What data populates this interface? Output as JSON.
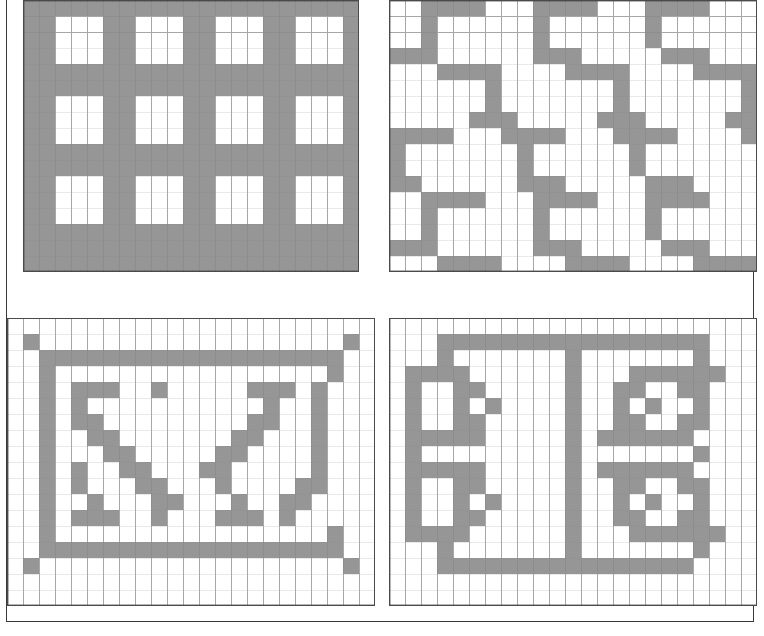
{
  "page": {
    "width": 764,
    "height": 636,
    "background_color": "#ffffff",
    "border_color": "#3a3a3a"
  },
  "style": {
    "fill_color": "#969696",
    "empty_color": "#ffffff",
    "gridline_color": "#8a8a8a",
    "panel_border_color": "#4a4a4a",
    "cell_size": 16
  },
  "panels": [
    {
      "id": "panel-top-left",
      "name": "lattice-grid-pattern",
      "description": "Regular lattice / window-pane grid of thick gray bars forming 4 rows by 5 columns of white squares",
      "cols": 21,
      "rows": 17,
      "origin_x": 22,
      "origin_y": 10,
      "rule": {
        "type": "lattice",
        "bar_cols": [
          0,
          1,
          5,
          6,
          10,
          11,
          15,
          16,
          20
        ],
        "bar_rows": [
          0,
          4,
          5,
          9,
          10,
          14,
          15,
          16
        ]
      }
    },
    {
      "id": "panel-top-right",
      "name": "zigzag-stair-pattern",
      "description": "Diagonal zigzag staircase bands of gray repeating across the grid",
      "cols": 23,
      "rows": 17,
      "origin_x": 398,
      "origin_y": 10,
      "rule": {
        "type": "zigzag",
        "period_x": 8,
        "period_y": 5,
        "segment_len": 4,
        "step": 3
      }
    },
    {
      "id": "panel-bottom-left",
      "name": "framed-z-glyph-pattern",
      "description": "Rectangular gray border frame with isolated corner dots, enclosing two mirrored diagonal Z-shaped glyphs",
      "cols": 23,
      "rows": 18,
      "origin_x": 22,
      "origin_y": 312,
      "rule": {
        "type": "framed-glyphs"
      }
    },
    {
      "id": "panel-bottom-right",
      "name": "maze-nested-squares-pattern",
      "description": "Maze-like pattern of nested square spirals with thick gray walls on left and right halves",
      "cols": 23,
      "rows": 18,
      "origin_x": 398,
      "origin_y": 312,
      "rule": {
        "type": "maze-nested"
      }
    }
  ],
  "pattern_data": {
    "panel-top-left": {
      "cols": 21,
      "rows": 17,
      "cells": [
        "111111111111111111111",
        "110001100011000110001",
        "110001100011000110001",
        "110001100011000110001",
        "111111111111111111111",
        "111111111111111111111",
        "110001100011000110001",
        "110001100011000110001",
        "110001100011000110001",
        "111111111111111111111",
        "111111111111111111111",
        "110001100011000110001",
        "110001100011000110001",
        "110001100011000110001",
        "111111111111111111111",
        "111111111111111111111",
        "111111111111111111111"
      ]
    },
    "panel-top-right": {
      "cols": 23,
      "rows": 17,
      "cells": [
        "00111100011110001111000",
        "00100000010000001000000",
        "00100000010000001000000",
        "11100000011100000111000",
        "00011110000111100001111",
        "00000010000000100000001",
        "00000010000000100000001",
        "00000111000001110000011",
        "11110001111000111100001",
        "10000000100000010000000",
        "10000000100000010000000",
        "11000000111000001110000",
        "00111100011110001111000",
        "00100000010000001000000",
        "00100000010000001000000",
        "11100000011100000111000",
        "00011110000111100001111"
      ]
    },
    "panel-bottom-left": {
      "cols": 23,
      "rows": 18,
      "cells": [
        "00000000000000000000000",
        "01000000000000000000010",
        "00111111111111111111100",
        "00100000000000000000100",
        "00101110010000011101000",
        "00101000000000001001000",
        "00101100000000011001000",
        "00100110000000110001000",
        "00100011000001100001000",
        "00101001100011000001000",
        "00101000110001000011000",
        "00100100011000100110000",
        "00101110010001110100000",
        "00100000000000000000100",
        "00111111111111111111100",
        "01000000000000000000010",
        "00000000000000000000000",
        "00000000000000000000000"
      ]
    },
    "panel-bottom-right": {
      "cols": 23,
      "rows": 18,
      "cells": [
        "00000000000000000000000",
        "00011111111111111111000",
        "00010000000100000001000",
        "01111000000100011111100",
        "01001100000100110011000",
        "01001010000100101001000",
        "01001100000100110011000",
        "01111100000101111110000",
        "01000000000100000001000",
        "01111100000101111110000",
        "01001100000100110011000",
        "01001010000100101001000",
        "01001100000100110011000",
        "01111000000100011111100",
        "00010000000100000001000",
        "00011111111111111110000",
        "00000000000000000000000",
        "00000000000000000000000"
      ]
    }
  }
}
